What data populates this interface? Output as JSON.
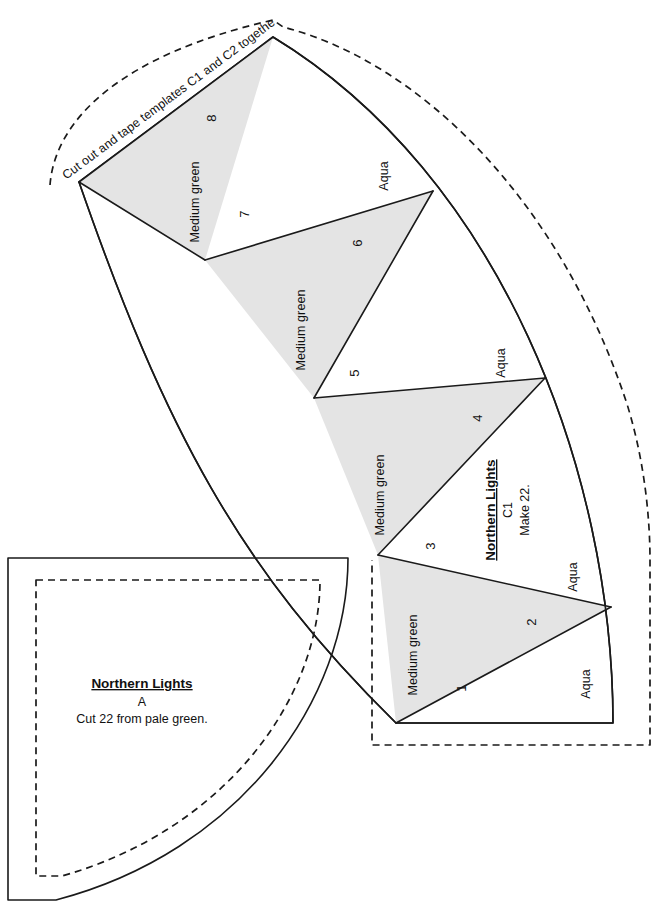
{
  "sheet": {
    "instruction": "Cut out and tape templates C1 and C2 together."
  },
  "template_c1": {
    "title": "Northern Lights",
    "code": "C1",
    "quantity_note": "Make 22.",
    "fabric_light": "Aqua",
    "fabric_dark": "Medium green",
    "pieces": [
      {
        "number": "1",
        "fabric": "Aqua",
        "shade": "light"
      },
      {
        "number": "2",
        "fabric": "Medium green",
        "shade": "dark"
      },
      {
        "number": "3",
        "fabric": "Aqua",
        "shade": "light"
      },
      {
        "number": "4",
        "fabric": "Medium green",
        "shade": "dark"
      },
      {
        "number": "5",
        "fabric": "Aqua",
        "shade": "light"
      },
      {
        "number": "6",
        "fabric": "Medium green",
        "shade": "dark"
      },
      {
        "number": "7",
        "fabric": "Aqua",
        "shade": "light"
      },
      {
        "number": "8",
        "fabric": "Medium green",
        "shade": "dark"
      }
    ],
    "fabric_labels_left": [
      "Medium green",
      "Medium green",
      "Medium green",
      "Medium green"
    ],
    "fabric_labels_right": [
      "Aqua",
      "Aqua",
      "Aqua",
      "Aqua"
    ]
  },
  "template_a": {
    "title": "Northern Lights",
    "code": "A",
    "cut_note": "Cut 22 from pale green."
  },
  "colors": {
    "dark_fabric_fill": "#e4e4e4",
    "light_fabric_fill": "#ffffff",
    "line": "#1a1a1a",
    "page_background": "#ffffff"
  },
  "line_styles": {
    "cut_line": "solid",
    "seam_line": "dashed"
  }
}
